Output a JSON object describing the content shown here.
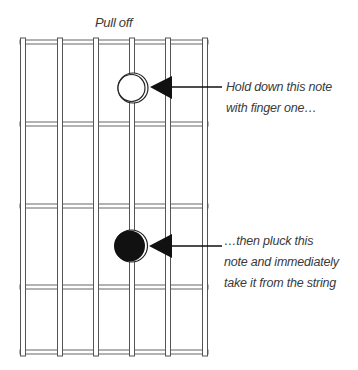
{
  "diagram": {
    "title": "Pull off",
    "colors": {
      "string_outline": "#555555",
      "fret": "#666666",
      "note_fill_filled": "#111111",
      "note_fill_open": "#ffffff",
      "arrow": "#111111",
      "text": "#3a3a3a"
    },
    "fretboard": {
      "strings": 6,
      "frets_visible": 4,
      "string_x": [
        23,
        60,
        96,
        132,
        168,
        205
      ],
      "fret_y": [
        42,
        124,
        206,
        287,
        353
      ]
    },
    "notes": [
      {
        "type": "open",
        "string": 4,
        "cx": 132,
        "cy": 88,
        "r": 14
      },
      {
        "type": "filled",
        "string": 4,
        "cx": 130,
        "cy": 246,
        "r": 15
      }
    ],
    "annotations": [
      {
        "lines": [
          "Hold down this note",
          "with finger one…"
        ]
      },
      {
        "lines": [
          "…then pluck this",
          "note and immediately",
          "take it from the string"
        ]
      }
    ]
  }
}
